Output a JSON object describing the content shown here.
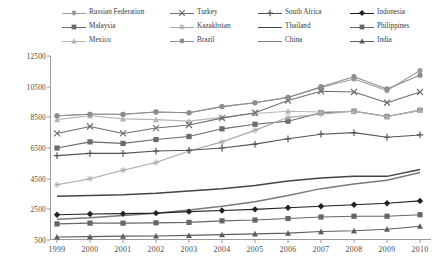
{
  "chart_data": {
    "type": "line",
    "title": "",
    "subtitle": "",
    "xlabel": "",
    "ylabel": "",
    "grid": false,
    "legend_position": "top",
    "legend_columns": 4,
    "x": [
      1999,
      2000,
      2001,
      2002,
      2003,
      2004,
      2005,
      2006,
      2007,
      2008,
      2009,
      2010
    ],
    "xtick_labels": [
      "1999",
      "2000",
      "2001",
      "2002",
      "2003",
      "2004",
      "2005",
      "2006",
      "2007",
      "2008",
      "2009",
      "2010"
    ],
    "ytick_labels": [
      "500",
      "2500",
      "4500",
      "6500",
      "8500",
      "10500",
      "12500"
    ],
    "ytick_values": [
      500,
      2500,
      4500,
      6500,
      8500,
      10500,
      12500
    ],
    "ylim": [
      500,
      12500
    ],
    "xlim": [
      1999,
      2010
    ],
    "series": [
      {
        "name": "Russian Federation",
        "marker": "circle",
        "color": "#9c9c9c",
        "values": [
          8600,
          8700,
          8700,
          8850,
          8800,
          9200,
          9450,
          9800,
          10450,
          11000,
          10250,
          11550
        ]
      },
      {
        "name": "Malaysia",
        "marker": "square",
        "color": "#6b6b6b",
        "values": [
          6500,
          6900,
          6800,
          7050,
          7250,
          7750,
          8050,
          8250,
          8800,
          8900,
          8550,
          8950
        ]
      },
      {
        "name": "Mexico",
        "marker": "triangle",
        "color": "#b4b4b4",
        "values": [
          8350,
          8600,
          8400,
          8350,
          8250,
          8500,
          8750,
          8900,
          8850,
          8900,
          8550,
          8950
        ]
      },
      {
        "name": "Turkey",
        "marker": "cross-x",
        "color": "#6f6f6f",
        "values": [
          7450,
          7900,
          7450,
          7800,
          8000,
          8450,
          8800,
          9600,
          10200,
          10150,
          9450,
          10150
        ]
      },
      {
        "name": "Kazakhstan",
        "marker": "star",
        "color": "#a8a8a8",
        "values": [
          4100,
          4500,
          5050,
          5550,
          6300,
          6900,
          7650,
          8500,
          8700,
          8900,
          8550,
          9000
        ]
      },
      {
        "name": "Brazil",
        "marker": "circle",
        "color": "#8e8e8e",
        "values": [
          8600,
          8700,
          8700,
          8850,
          8800,
          9200,
          9450,
          9800,
          10500,
          11150,
          10350,
          11250
        ]
      },
      {
        "name": "South Africa",
        "marker": "plus",
        "color": "#555555",
        "values": [
          6000,
          6150,
          6150,
          6300,
          6350,
          6500,
          6750,
          7100,
          7400,
          7500,
          7200,
          7350
        ]
      },
      {
        "name": "Thailand",
        "marker": "none",
        "color": "#444444",
        "values": [
          3350,
          3400,
          3450,
          3550,
          3700,
          3850,
          4050,
          4350,
          4550,
          4650,
          4650,
          5100
        ]
      },
      {
        "name": "China",
        "marker": "none",
        "color": "#7a7a7a",
        "values": [
          1850,
          1950,
          2100,
          2250,
          2450,
          2700,
          3000,
          3400,
          3850,
          4150,
          4400,
          4900
        ]
      },
      {
        "name": "Indonesia",
        "marker": "diamond",
        "color": "#222222",
        "values": [
          2150,
          2200,
          2220,
          2250,
          2350,
          2420,
          2500,
          2600,
          2700,
          2800,
          2900,
          3050
        ]
      },
      {
        "name": "Philippines",
        "marker": "square",
        "color": "#676767",
        "values": [
          1550,
          1600,
          1600,
          1620,
          1650,
          1750,
          1800,
          1900,
          2000,
          2050,
          2050,
          2150
        ]
      },
      {
        "name": "India",
        "marker": "triangle",
        "color": "#5d5d5d",
        "values": [
          700,
          720,
          750,
          760,
          800,
          850,
          900,
          950,
          1050,
          1100,
          1200,
          1400
        ]
      }
    ]
  }
}
